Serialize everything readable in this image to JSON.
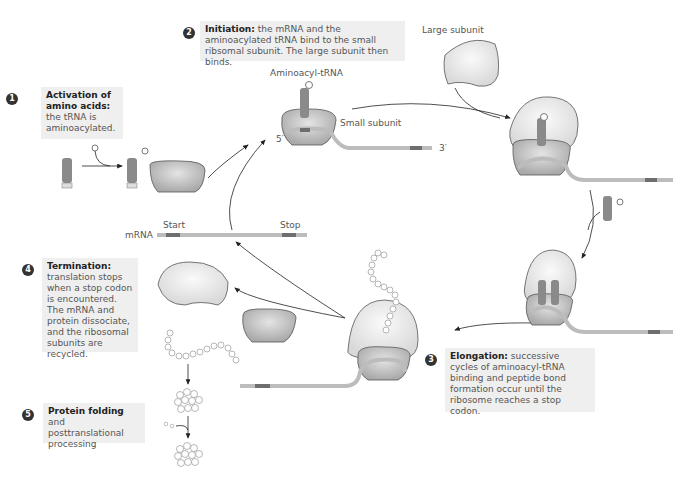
{
  "steps": [
    {
      "number": "1",
      "title": "Activation of amino acids:",
      "body": "the tRNA is aminoacylated."
    },
    {
      "number": "2",
      "title": "Initiation:",
      "body": "the mRNA and the aminoacylated tRNA bind to the small ribsomal subunit. The large subunit then binds."
    },
    {
      "number": "3",
      "title": "Elongation:",
      "body": "successive cycles of aminoacyl-tRNA binding and peptide bond formation occur until the ribosome reaches a stop codon."
    },
    {
      "number": "4",
      "title": "Termination:",
      "body": "translation stops when a stop codon is encountered. The mRNA and protein dissociate, and the ribosomal subunits are recycled."
    },
    {
      "number": "5",
      "title": "Protein folding",
      "body": "and posttranslational processing"
    }
  ],
  "labels": {
    "aminoacyl_trna": "Aminoacyl-tRNA",
    "small_subunit": "Small subunit",
    "large_subunit": "Large subunit",
    "five_prime": "5′",
    "three_prime": "3′",
    "mrna": "mRNA",
    "start": "Start",
    "stop": "Stop"
  },
  "colors": {
    "box_bg": "#efefef",
    "badge": "#333333",
    "subunit_light": "#e6e6e6",
    "subunit_dark": "#bdbdbd",
    "mrna": "#bcbcbc",
    "codon": "#6e6e6e",
    "arrow": "#222222"
  }
}
